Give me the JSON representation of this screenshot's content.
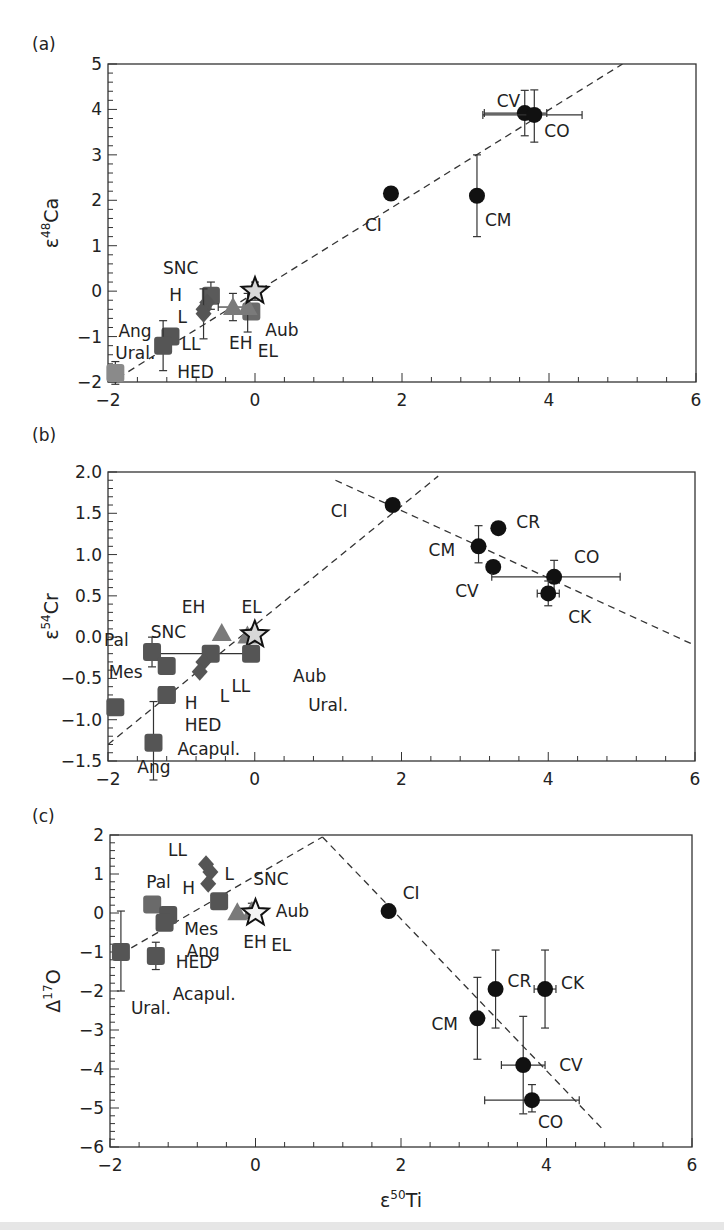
{
  "figure": {
    "xlabel": "ε",
    "xlabel_sup": "50",
    "xlabel_tail": "Ti"
  },
  "chart_data": [
    {
      "panel": "(a)",
      "type": "scatter",
      "title": "",
      "xlabel": "ε50Ti",
      "ylabel": "ε48Ca",
      "ylabel_parts": {
        "base": "ε",
        "sup": "48",
        "tail": "Ca"
      },
      "xlim": [
        -2,
        6
      ],
      "ylim": [
        -2,
        5
      ],
      "xticks": [
        -2,
        0,
        2,
        4,
        6
      ],
      "xtick_labels": [
        "−2",
        "0",
        "2",
        "4",
        "6"
      ],
      "yticks": [
        -2,
        -1,
        0,
        1,
        2,
        3,
        4,
        5
      ],
      "ytick_labels": [
        "−2",
        "−1",
        "0",
        "1",
        "2",
        "3",
        "4",
        "5"
      ],
      "grid": false,
      "box": {
        "x0": 108,
        "x1": 696,
        "y0": 64,
        "y1": 382
      },
      "label_pos": [
        32,
        50
      ],
      "lines": [
        {
          "x": [
            -2,
            5
          ],
          "y": [
            -2.05,
            5
          ],
          "style": "dashed"
        }
      ],
      "points": [
        {
          "name": "CV",
          "x": 3.67,
          "y": 3.92,
          "marker": "circle",
          "color": "#111111",
          "xerr": [
            0.55,
            0.3
          ],
          "yerr": [
            0.5,
            0.5
          ],
          "label_dx": -28,
          "label_dy": -12
        },
        {
          "name": "CO",
          "x": 3.8,
          "y": 3.88,
          "marker": "circle",
          "color": "#111111",
          "xerr": [
            0.7,
            0.65
          ],
          "yerr": [
            0.6,
            0.55
          ],
          "label_dx": 10,
          "label_dy": 16
        },
        {
          "name": "CI",
          "x": 1.85,
          "y": 2.15,
          "marker": "circle",
          "color": "#111111",
          "label_dx": -26,
          "label_dy": 32
        },
        {
          "name": "CM",
          "x": 3.02,
          "y": 2.1,
          "marker": "circle",
          "color": "#111111",
          "yerr": [
            0.9,
            0.9
          ],
          "label_dx": 8,
          "label_dy": 24
        },
        {
          "name": "SNC",
          "x": -0.6,
          "y": -0.1,
          "marker": "square",
          "color": "#5a5a5a",
          "yerr": [
            0.3,
            0.3
          ],
          "label_dx": -48,
          "label_dy": -28
        },
        {
          "name": "H",
          "x": -0.65,
          "y": -0.25,
          "marker": "diamond",
          "color": "#555555",
          "label_dx": -38,
          "label_dy": -8
        },
        {
          "name": "L",
          "x": -0.7,
          "y": -0.4,
          "marker": "diamond",
          "color": "#555555",
          "label_dx": -26,
          "label_dy": 8
        },
        {
          "name": "LL",
          "x": -0.7,
          "y": -0.5,
          "marker": "diamond",
          "color": "#555555",
          "yerr": [
            0.55,
            0.55
          ],
          "label_dx": -22,
          "label_dy": 30
        },
        {
          "name": "EH",
          "x": -0.3,
          "y": -0.35,
          "marker": "triangle",
          "color": "#7a7a7a",
          "yerr": [
            0.3,
            0.3
          ],
          "xerr": [
            0.2,
            0.2
          ],
          "label_dx": -4,
          "label_dy": 36
        },
        {
          "name": "Aub",
          "x": -0.05,
          "y": -0.45,
          "marker": "square",
          "color": "#6a6a6a",
          "label_dx": 14,
          "label_dy": 18
        },
        {
          "name": "EL",
          "x": -0.1,
          "y": -0.35,
          "marker": "triangle",
          "color": "#7a7a7a",
          "yerr": [
            0.55,
            0.3
          ],
          "label_dx": 10,
          "label_dy": 44
        },
        {
          "name": "Ang",
          "x": -1.15,
          "y": -1.0,
          "marker": "square",
          "color": "#555555",
          "label_dx": -52,
          "label_dy": -6
        },
        {
          "name": "HED",
          "x": -1.25,
          "y": -1.2,
          "marker": "square",
          "color": "#555555",
          "yerr": [
            0.55,
            0.55
          ],
          "label_dx": 14,
          "label_dy": 26
        },
        {
          "name": "Ural.",
          "x": -1.9,
          "y": -1.8,
          "marker": "square",
          "color": "#8a8a8a",
          "yerr": [
            0.25,
            0.25
          ],
          "label_dx": 0,
          "label_dy": -20
        },
        {
          "name": "Earth",
          "x": 0.0,
          "y": 0.0,
          "marker": "star",
          "color": "#d8d8d8",
          "yerr": [
            0.2,
            0.2
          ],
          "label": ""
        }
      ]
    },
    {
      "panel": "(b)",
      "type": "scatter",
      "title": "",
      "xlabel": "ε50Ti",
      "ylabel": "ε54Cr",
      "ylabel_parts": {
        "base": "ε",
        "sup": "54",
        "tail": "Cr"
      },
      "xlim": [
        -2,
        6
      ],
      "ylim": [
        -1.5,
        2.0
      ],
      "xticks": [
        -2,
        0,
        2,
        4,
        6
      ],
      "xtick_labels": [
        "−2",
        "0",
        "2",
        "4",
        "6"
      ],
      "yticks": [
        -1.5,
        -1.0,
        -0.5,
        0.0,
        0.5,
        1.0,
        1.5,
        2.0
      ],
      "ytick_labels": [
        "−1.5",
        "−1.0",
        "−0.5",
        "0.0",
        "0.5",
        "1.0",
        "1.5",
        "2.0"
      ],
      "grid": false,
      "box": {
        "x0": 108,
        "x1": 695,
        "y0": 472,
        "y1": 761
      },
      "label_pos": [
        32,
        441
      ],
      "lines": [
        {
          "x": [
            -2,
            2.5
          ],
          "y": [
            -1.3,
            1.95
          ],
          "style": "dashed"
        },
        {
          "x": [
            1.1,
            6
          ],
          "y": [
            1.9,
            -0.1
          ],
          "style": "dashed"
        }
      ],
      "points": [
        {
          "name": "CI",
          "x": 1.88,
          "y": 1.6,
          "marker": "circle",
          "color": "#111111",
          "label_dx": -62,
          "label_dy": 6
        },
        {
          "name": "CR",
          "x": 3.32,
          "y": 1.32,
          "marker": "circle",
          "color": "#111111",
          "label_dx": 18,
          "label_dy": -6
        },
        {
          "name": "CM",
          "x": 3.05,
          "y": 1.1,
          "marker": "circle",
          "color": "#111111",
          "yerr": [
            0.2,
            0.25
          ],
          "label_dx": -50,
          "label_dy": 4
        },
        {
          "name": "CV",
          "x": 3.25,
          "y": 0.85,
          "marker": "circle",
          "color": "#111111",
          "label_dx": -38,
          "label_dy": 24
        },
        {
          "name": "CO",
          "x": 4.08,
          "y": 0.73,
          "marker": "circle",
          "color": "#111111",
          "xerr": [
            0.85,
            0.9
          ],
          "yerr": [
            0.2,
            0.2
          ],
          "label_dx": 20,
          "label_dy": -20
        },
        {
          "name": "CK",
          "x": 4.0,
          "y": 0.53,
          "marker": "circle",
          "color": "#111111",
          "xerr": [
            0.15,
            0.15
          ],
          "yerr": [
            0.15,
            0.15
          ],
          "label_dx": 20,
          "label_dy": 24
        },
        {
          "name": "EH",
          "x": -0.45,
          "y": 0.05,
          "marker": "triangle",
          "color": "#7a7a7a",
          "label_dx": -40,
          "label_dy": -26
        },
        {
          "name": "EL",
          "x": -0.1,
          "y": 0.02,
          "marker": "triangle",
          "color": "#7a7a7a",
          "label_dx": -6,
          "label_dy": -28
        },
        {
          "name": "Earth",
          "x": 0.0,
          "y": 0.03,
          "marker": "star",
          "color": "#d8d8d8",
          "label": ""
        },
        {
          "name": "Aub",
          "x": -0.05,
          "y": -0.2,
          "marker": "square",
          "color": "#555555",
          "xerr": [
            1.4,
            0.05
          ],
          "label_dx": 42,
          "label_dy": 22
        },
        {
          "name": "Pal",
          "x": -1.4,
          "y": -0.18,
          "marker": "square",
          "color": "#555555",
          "yerr": [
            0.18,
            0.18
          ],
          "label_dx": -48,
          "label_dy": -12
        },
        {
          "name": "SNC",
          "x": -0.6,
          "y": -0.2,
          "marker": "square",
          "color": "#555555",
          "label_dx": -60,
          "label_dy": -22
        },
        {
          "name": "Mes",
          "x": -1.2,
          "y": -0.35,
          "marker": "square",
          "color": "#555555",
          "label_dx": -58,
          "label_dy": 6
        },
        {
          "name": "LL",
          "x": -0.7,
          "y": -0.3,
          "marker": "diamond",
          "color": "#555555",
          "label_dx": 28,
          "label_dy": 24
        },
        {
          "name": "L",
          "x": -0.75,
          "y": -0.42,
          "marker": "diamond",
          "color": "#555555",
          "label_dx": 20,
          "label_dy": 24
        },
        {
          "name": "Ang",
          "x": -1.9,
          "y": -0.85,
          "marker": "square",
          "color": "#555555",
          "label_dx": 22,
          "label_dy": 60
        },
        {
          "name": "H",
          "x": -1.2,
          "y": -0.7,
          "marker": "square",
          "color": "#555555",
          "label_dx": 18,
          "label_dy": 8
        },
        {
          "name": "HED",
          "x": -1.2,
          "y": -0.7,
          "marker": "square",
          "color": "#555555",
          "xerr": [
            0.05,
            0.1
          ],
          "label_dx": 18,
          "label_dy": 30
        },
        {
          "name": "Ural.",
          "x": 1.0,
          "y": -0.75,
          "marker": "none",
          "color": "#555555",
          "label_dx": -20,
          "label_dy": 6
        },
        {
          "name": "Acapul.",
          "x": -1.38,
          "y": -1.28,
          "marker": "square",
          "color": "#555555",
          "yerr": [
            0.45,
            0.5
          ],
          "label_dx": 24,
          "label_dy": 6
        }
      ]
    },
    {
      "panel": "(c)",
      "type": "scatter",
      "title": "",
      "xlabel": "ε50Ti",
      "ylabel": "Δ17O",
      "ylabel_parts": {
        "base": "Δ",
        "sup": "17",
        "tail": "O"
      },
      "xlim": [
        -2,
        6
      ],
      "ylim": [
        -6,
        2
      ],
      "xticks": [
        -2,
        0,
        2,
        4,
        6
      ],
      "xtick_labels": [
        "−2",
        "0",
        "2",
        "4",
        "6"
      ],
      "yticks": [
        -6,
        -5,
        -4,
        -3,
        -2,
        -1,
        0,
        1,
        2
      ],
      "ytick_labels": [
        "−6",
        "−5",
        "−4",
        "−3",
        "−2",
        "−1",
        "0",
        "1",
        "2"
      ],
      "grid": false,
      "box": {
        "x0": 110,
        "x1": 692,
        "y0": 835,
        "y1": 1147
      },
      "label_pos": [
        32,
        822
      ],
      "lines": [
        {
          "x": [
            -1.85,
            0.92
          ],
          "y": [
            -1.05,
            1.95
          ],
          "style": "dashed"
        },
        {
          "x": [
            0.92,
            4.8
          ],
          "y": [
            1.95,
            -5.6
          ],
          "style": "dashed"
        }
      ],
      "points": [
        {
          "name": "CI",
          "x": 1.83,
          "y": 0.05,
          "marker": "circle",
          "color": "#111111",
          "label_dx": 14,
          "label_dy": -18
        },
        {
          "name": "CR",
          "x": 3.3,
          "y": -1.95,
          "marker": "circle",
          "color": "#111111",
          "yerr": [
            1.0,
            1.0
          ],
          "label_dx": 12,
          "label_dy": -8
        },
        {
          "name": "CK",
          "x": 3.98,
          "y": -1.95,
          "marker": "circle",
          "color": "#111111",
          "xerr": [
            0.15,
            0.15
          ],
          "yerr": [
            1.0,
            1.0
          ],
          "label_dx": 16,
          "label_dy": -6
        },
        {
          "name": "CM",
          "x": 3.05,
          "y": -2.7,
          "marker": "circle",
          "color": "#111111",
          "yerr": [
            1.05,
            1.05
          ],
          "label_dx": -46,
          "label_dy": 6
        },
        {
          "name": "CV",
          "x": 3.68,
          "y": -3.9,
          "marker": "circle",
          "color": "#111111",
          "xerr": [
            0.3,
            0.3
          ],
          "yerr": [
            1.25,
            1.25
          ],
          "label_dx": 36,
          "label_dy": 0
        },
        {
          "name": "CO",
          "x": 3.8,
          "y": -4.8,
          "marker": "circle",
          "color": "#111111",
          "xerr": [
            0.65,
            0.65
          ],
          "yerr": [
            0.3,
            0.4
          ],
          "label_dx": 6,
          "label_dy": 22
        },
        {
          "name": "LL",
          "x": -0.68,
          "y": 1.25,
          "marker": "diamond",
          "color": "#555555",
          "label_dx": -38,
          "label_dy": -14
        },
        {
          "name": "L",
          "x": -0.62,
          "y": 1.05,
          "marker": "diamond",
          "color": "#555555",
          "label_dx": 14,
          "label_dy": 2
        },
        {
          "name": "H",
          "x": -0.65,
          "y": 0.75,
          "marker": "diamond",
          "color": "#555555",
          "label_dx": -26,
          "label_dy": 4
        },
        {
          "name": "SNC",
          "x": -0.5,
          "y": 0.3,
          "marker": "square",
          "color": "#555555",
          "label_dx": 34,
          "label_dy": -22
        },
        {
          "name": "Pal",
          "x": -1.42,
          "y": 0.22,
          "marker": "square",
          "color": "#6a6a6a",
          "label_dx": -6,
          "label_dy": -22
        },
        {
          "name": "Mes",
          "x": -1.2,
          "y": -0.05,
          "marker": "square",
          "color": "#555555",
          "label_dx": 16,
          "label_dy": 14
        },
        {
          "name": "Ang",
          "x": -1.25,
          "y": -0.25,
          "marker": "square",
          "color": "#555555",
          "label_dx": 22,
          "label_dy": 28
        },
        {
          "name": "EH",
          "x": -0.25,
          "y": 0.02,
          "marker": "triangle",
          "color": "#7a7a7a",
          "label_dx": 6,
          "label_dy": 30
        },
        {
          "name": "Aub",
          "x": -0.05,
          "y": 0.05,
          "marker": "triangle",
          "color": "#7a7a7a",
          "yerr": [
            0.2,
            0.2
          ],
          "label_dx": 24,
          "label_dy": 0
        },
        {
          "name": "Earth",
          "x": 0.0,
          "y": 0.0,
          "marker": "star",
          "color": "#f4f4f4",
          "label": ""
        },
        {
          "name": "EL",
          "x": 0.05,
          "y": -0.2,
          "marker": "none",
          "color": "#555555",
          "label_dx": 12,
          "label_dy": 24
        },
        {
          "name": "Ural.",
          "x": -1.85,
          "y": -1.0,
          "marker": "square",
          "color": "#555555",
          "yerr": [
            1.0,
            1.05
          ],
          "label_dx": 10,
          "label_dy": 56
        },
        {
          "name": "HED",
          "x": -1.37,
          "y": -1.1,
          "marker": "square",
          "color": "#555555",
          "yerr": [
            0.35,
            0.35
          ],
          "label_dx": 20,
          "label_dy": 6
        },
        {
          "name": "Acapul.",
          "x": -1.0,
          "y": -1.1,
          "marker": "none",
          "color": "#555555",
          "label_dx": -10,
          "label_dy": 38
        }
      ]
    }
  ]
}
